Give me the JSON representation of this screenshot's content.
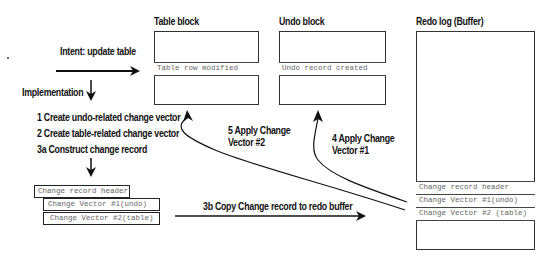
{
  "blocks": {
    "table": {
      "title": "Table block",
      "row": "Table row modified"
    },
    "undo": {
      "title": "Undo block",
      "row": "Undo record created"
    },
    "redo": {
      "title": "Redo log (Buffer)",
      "rows": [
        "Change record header",
        "Change Vector #1(undo)",
        "Change Vector #2 (table)"
      ]
    }
  },
  "intent": {
    "label": "Intent: update table"
  },
  "implementation": {
    "label": "Implementation",
    "steps": [
      "1 Create undo-related change vector",
      "2 Create table-related change vector",
      "3a Construct change record"
    ]
  },
  "change_record": {
    "header": "Change record header",
    "vectors": [
      "Change Vector #1(undo)",
      "Change Vector #2(table)"
    ]
  },
  "arrows": {
    "copy": "3b Copy Change record to redo buffer",
    "apply1_line1": "4 Apply Change",
    "apply1_line2": "Vector #1",
    "apply2_line1": "5 Apply Change",
    "apply2_line2": "Vector #2"
  }
}
